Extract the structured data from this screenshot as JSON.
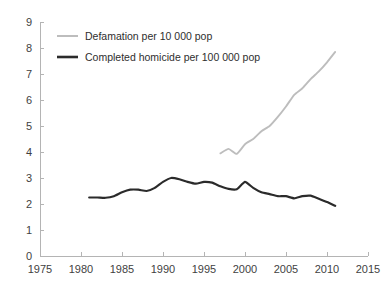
{
  "chart_data": {
    "type": "line",
    "title": "",
    "xlabel": "",
    "ylabel": "",
    "xlim": [
      1975,
      2015
    ],
    "ylim": [
      0,
      9
    ],
    "xticks": [
      1975,
      1980,
      1985,
      1990,
      1995,
      2000,
      2005,
      2010,
      2015
    ],
    "yticks": [
      0,
      1,
      2,
      3,
      4,
      5,
      6,
      7,
      8,
      9
    ],
    "grid": false,
    "legend_position": "top-left",
    "series": [
      {
        "name": "Defamation per 10 000 pop",
        "color": "#bdbdbd",
        "x": [
          1997,
          1998,
          1999,
          2000,
          2001,
          2002,
          2003,
          2004,
          2005,
          2006,
          2007,
          2008,
          2009,
          2010,
          2011
        ],
        "values": [
          3.95,
          4.12,
          3.93,
          4.3,
          4.5,
          4.8,
          5.0,
          5.35,
          5.75,
          6.2,
          6.45,
          6.8,
          7.1,
          7.45,
          7.85
        ]
      },
      {
        "name": "Completed homicide per 100 000 pop",
        "color": "#2b2b2b",
        "x": [
          1981,
          1982,
          1983,
          1984,
          1985,
          1986,
          1987,
          1988,
          1989,
          1990,
          1991,
          1992,
          1993,
          1994,
          1995,
          1996,
          1997,
          1998,
          1999,
          2000,
          2001,
          2002,
          2003,
          2004,
          2005,
          2006,
          2007,
          2008,
          2009,
          2010,
          2011
        ],
        "values": [
          2.25,
          2.25,
          2.24,
          2.3,
          2.45,
          2.55,
          2.55,
          2.5,
          2.62,
          2.85,
          3.0,
          2.95,
          2.85,
          2.78,
          2.85,
          2.82,
          2.68,
          2.58,
          2.57,
          2.85,
          2.62,
          2.45,
          2.38,
          2.3,
          2.3,
          2.22,
          2.3,
          2.32,
          2.2,
          2.08,
          1.93
        ]
      }
    ]
  },
  "axes": {
    "x_tick_labels": [
      "1975",
      "1980",
      "1985",
      "1990",
      "1995",
      "2000",
      "2005",
      "2010",
      "2015"
    ],
    "y_tick_labels": [
      "0",
      "1",
      "2",
      "3",
      "4",
      "5",
      "6",
      "7",
      "8",
      "9"
    ]
  },
  "legend": {
    "items": [
      {
        "label": "Defamation per 10 000 pop",
        "color": "#bdbdbd"
      },
      {
        "label": "Completed homicide per 100 000 pop",
        "color": "#2b2b2b"
      }
    ]
  },
  "colors": {
    "defamation_line": "#bdbdbd",
    "homicide_line": "#2b2b2b",
    "axis": "#b4b4b4",
    "text": "#3f3f3f",
    "background": "#ffffff"
  }
}
